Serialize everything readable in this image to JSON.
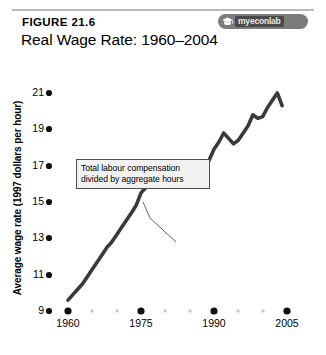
{
  "header": {
    "figure_number": "FIGURE 21.6",
    "title": "Real Wage Rate: 1960–2004",
    "badge": {
      "text": "myeconlab",
      "icon": "mortarboard-icon",
      "bg_color": "#7b7b7b",
      "plate_color": "#4a4a4a"
    },
    "rule_color": "#b9b9b9"
  },
  "annotation": {
    "line1": "Total labour compensation",
    "line2": "divided by aggregate hours",
    "border_color": "#4d4d4d",
    "fill_color": "#f2f2f2"
  },
  "axes": {
    "y_title": "Average wage rate (1997 dollars per hour)",
    "x_title": "Year",
    "y_ticks": [
      "9",
      "11",
      "13",
      "15",
      "17",
      "19",
      "21"
    ],
    "x_ticks": [
      "1960",
      "1975",
      "1990",
      "2005"
    ]
  },
  "chart_data": {
    "type": "line",
    "title": "Real Wage Rate: 1960–2004",
    "subtitle": "FIGURE 21.6",
    "xlabel": "Year",
    "ylabel": "Average wage rate (1997 dollars per hour)",
    "xlim": [
      1958,
      2007
    ],
    "ylim": [
      9,
      22
    ],
    "ytick_values": [
      9,
      11,
      13,
      15,
      17,
      19,
      21
    ],
    "xtick_values": [
      1960,
      1975,
      1990,
      2005
    ],
    "xtick_minor_values": [
      1965,
      1970,
      1980,
      1985,
      1995,
      2000
    ],
    "grid": false,
    "legend": null,
    "line_color": "#3a3a3a",
    "line_width": 3.6,
    "annotations": [
      {
        "text": "Total labour compensation divided by aggregate hours",
        "points_to_year": 1980,
        "points_to_value": 16.6
      }
    ],
    "series": [
      {
        "name": "Real wage rate",
        "x": [
          1960,
          1961,
          1962,
          1963,
          1964,
          1965,
          1966,
          1967,
          1968,
          1969,
          1970,
          1971,
          1972,
          1973,
          1974,
          1975,
          1976,
          1977,
          1978,
          1979,
          1980,
          1981,
          1982,
          1983,
          1984,
          1985,
          1986,
          1987,
          1988,
          1989,
          1990,
          1991,
          1992,
          1993,
          1994,
          1995,
          1996,
          1997,
          1998,
          1999,
          2000,
          2001,
          2002,
          2003,
          2004
        ],
        "values": [
          9.6,
          9.9,
          10.2,
          10.5,
          10.9,
          11.3,
          11.7,
          12.1,
          12.5,
          12.8,
          13.2,
          13.6,
          14.0,
          14.4,
          14.8,
          15.5,
          15.8,
          16.1,
          16.4,
          16.1,
          15.9,
          16.1,
          16.2,
          16.1,
          16.3,
          16.5,
          16.6,
          16.7,
          17.0,
          17.3,
          17.9,
          18.3,
          18.8,
          18.5,
          18.2,
          18.4,
          18.8,
          19.2,
          19.8,
          19.6,
          19.7,
          20.2,
          20.6,
          21.0,
          20.3
        ]
      }
    ]
  }
}
